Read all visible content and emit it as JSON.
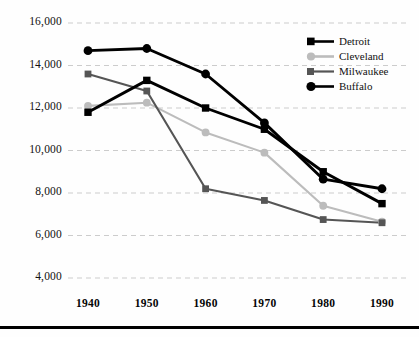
{
  "chart_data": {
    "type": "line",
    "title": "",
    "subtitle": "",
    "xlabel": "",
    "ylabel": "",
    "categories": [
      "1940",
      "1950",
      "1960",
      "1970",
      "1980",
      "1990"
    ],
    "x": [
      1940,
      1950,
      1960,
      1970,
      1980,
      1990
    ],
    "xlim": [
      1940,
      1990
    ],
    "ylim": [
      4000,
      16000
    ],
    "ytick_labels": [
      "16,000",
      "14,000",
      "12,000",
      "10,000",
      "8,000",
      "6,000",
      "4,000"
    ],
    "ytick_values": [
      16000,
      14000,
      12000,
      10000,
      8000,
      6000,
      4000
    ],
    "xtick_labels": [
      "1940",
      "1950",
      "1960",
      "1970",
      "1980",
      "1990"
    ],
    "grid": "horizontal-dashed",
    "grid_color": "#cccccc",
    "legend_position": "top-right",
    "series": [
      {
        "name": "Detroit",
        "color": "#000000",
        "marker": "square",
        "values": [
          11800,
          13300,
          12000,
          11000,
          9000,
          7500
        ]
      },
      {
        "name": "Cleveland",
        "color": "#bcbcbc",
        "marker": "circle",
        "values": [
          12100,
          12250,
          10850,
          9900,
          7400,
          6650
        ]
      },
      {
        "name": "Milwaukee",
        "color": "#555555",
        "marker": "square",
        "values": [
          13600,
          12800,
          8200,
          7650,
          6750,
          6600
        ]
      },
      {
        "name": "Buffalo",
        "color": "#000000",
        "marker": "circle",
        "values": [
          14700,
          14800,
          13600,
          11300,
          8650,
          8200
        ]
      }
    ]
  },
  "legend": {
    "items": [
      {
        "label": "Detroit"
      },
      {
        "label": "Cleveland"
      },
      {
        "label": "Milwaukee"
      },
      {
        "label": "Buffalo"
      }
    ]
  },
  "axes": {
    "y_labels": [
      "16,000",
      "14,000",
      "12,000",
      "10,000",
      "8,000",
      "6,000",
      "4,000"
    ],
    "x_labels": [
      "1940",
      "1950",
      "1960",
      "1970",
      "1980",
      "1990"
    ]
  }
}
